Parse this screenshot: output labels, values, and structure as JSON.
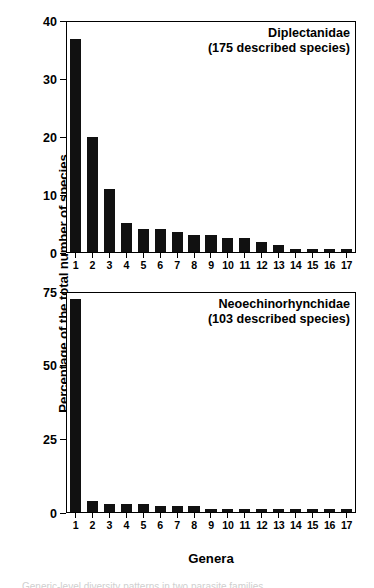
{
  "figure": {
    "axis_title_y": "Percentage of the total number of species",
    "axis_title_x": "Genera",
    "caption": "Generic-level diversity patterns in two parasite families."
  },
  "chart_data": [
    {
      "type": "bar",
      "title": "Diplectanidae",
      "subtitle": "(175 described species)",
      "xlabel": "Genera",
      "ylabel": "Percentage of the total number of species",
      "categories": [
        "1",
        "2",
        "3",
        "4",
        "5",
        "6",
        "7",
        "8",
        "9",
        "10",
        "11",
        "12",
        "13",
        "14",
        "15",
        "16",
        "17"
      ],
      "values": [
        37,
        20,
        11,
        5,
        4,
        4,
        3.4,
        3,
        3,
        2.4,
        2.4,
        1.8,
        1.2,
        0.6,
        0.6,
        0.6,
        0.6
      ],
      "ylim": [
        0,
        40
      ],
      "yticks": [
        0,
        10,
        20,
        30,
        40
      ],
      "grid": false,
      "legend": "none",
      "bar_color": "#111111"
    },
    {
      "type": "bar",
      "title": "Neoechinorhynchidae",
      "subtitle": "(103 described species)",
      "xlabel": "Genera",
      "ylabel": "Percentage of the total number of species",
      "categories": [
        "1",
        "2",
        "3",
        "4",
        "5",
        "6",
        "7",
        "8",
        "9",
        "10",
        "11",
        "12",
        "13",
        "14",
        "15",
        "16",
        "17"
      ],
      "values": [
        73,
        3.9,
        2.9,
        2.9,
        2.9,
        1.9,
        1.9,
        1.9,
        1.0,
        1.0,
        1.0,
        1.0,
        1.0,
        1.0,
        1.0,
        1.0,
        1.0
      ],
      "ylim": [
        0,
        75
      ],
      "yticks": [
        0,
        25,
        50,
        75
      ],
      "grid": false,
      "legend": "none",
      "bar_color": "#111111"
    }
  ]
}
